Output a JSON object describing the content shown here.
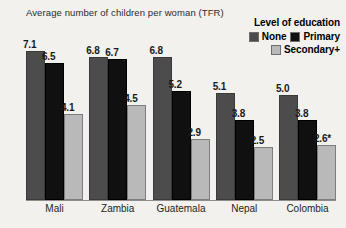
{
  "chart_data": {
    "type": "bar",
    "title": "Average number of children per woman (TFR)",
    "xlabel": "",
    "ylabel": "",
    "ylim": [
      0,
      7.6
    ],
    "grid": false,
    "legend_position": "top-right",
    "legend_title": "Level of education",
    "categories": [
      "Mali",
      "Zambia",
      "Guatemala",
      "Nepal",
      "Colombia"
    ],
    "series": [
      {
        "name": "None",
        "color": "#4c4c4c",
        "values": [
          7.1,
          6.8,
          6.8,
          5.1,
          5.0
        ],
        "labels": [
          "7.1",
          "6.8",
          "6.8",
          "5.1",
          "5.0"
        ]
      },
      {
        "name": "Primary",
        "color": "#101010",
        "values": [
          6.5,
          6.7,
          5.2,
          3.8,
          3.8
        ],
        "labels": [
          "6.5",
          "6.7",
          "5.2",
          "3.8",
          "3.8"
        ]
      },
      {
        "name": "Secondary+",
        "color": "#b9b9b9",
        "values": [
          4.1,
          4.5,
          2.9,
          2.5,
          2.6
        ],
        "labels": [
          "4.1",
          "4.5",
          "2.9",
          "2.5",
          "2.6*"
        ]
      }
    ]
  },
  "legend": {
    "title": "Level of education",
    "entries": [
      {
        "label": "None",
        "color": "#4c4c4c"
      },
      {
        "label": "Primary",
        "color": "#101010"
      },
      {
        "label": "Secondary+",
        "color": "#b9b9b9"
      }
    ]
  }
}
